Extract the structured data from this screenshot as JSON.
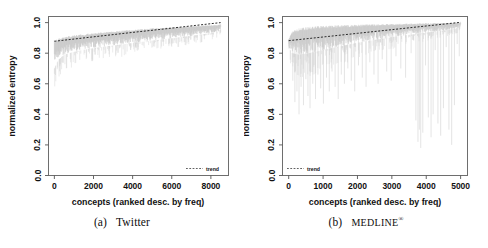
{
  "figure": {
    "kind": "two-panel-figure",
    "background": "#ffffff",
    "data_color": "#c8c8c8",
    "trend_color": "#1a1a1a",
    "axis_color": "#555555"
  },
  "panels": [
    {
      "id": "twitter",
      "caption_prefix": "(a)",
      "caption_name": "Twitter",
      "legend": {
        "label": "trend",
        "position": "bottom-right"
      }
    },
    {
      "id": "medline",
      "caption_prefix": "(b)",
      "caption_name": "MEDLINE",
      "caption_mark": "®",
      "legend": {
        "label": "trend",
        "position": "bottom-left"
      }
    }
  ],
  "chart_data": [
    {
      "type": "area",
      "id": "twitter",
      "title": "",
      "xlabel": "concepts (ranked desc. by freq)",
      "ylabel": "normalized entropy",
      "xlim": [
        -300,
        8900
      ],
      "ylim": [
        0.0,
        1.04
      ],
      "xticks": [
        0,
        2000,
        4000,
        6000,
        8000
      ],
      "xtick_labels": [
        "0",
        "2000",
        "4000",
        "6000",
        "8000"
      ],
      "yticks": [
        0.0,
        0.2,
        0.4,
        0.6,
        0.8,
        1.0
      ],
      "ytick_labels": [
        "0.0",
        "0.2",
        "0.4",
        "0.6",
        "0.8",
        "1.0"
      ],
      "grid": false,
      "legend": [
        "trend"
      ],
      "legend_position": "bottom-right",
      "n_points": 8500,
      "series": [
        {
          "name": "normalized entropy (upper envelope)",
          "style": "band-top",
          "color": "#c8c8c8",
          "x": [
            0,
            200,
            500,
            900,
            1400,
            2000,
            2700,
            3400,
            4100,
            4800,
            5500,
            6200,
            6900,
            7500,
            8000,
            8400,
            8500
          ],
          "values": [
            0.885,
            0.895,
            0.905,
            0.915,
            0.923,
            0.932,
            0.94,
            0.947,
            0.954,
            0.96,
            0.966,
            0.971,
            0.976,
            0.98,
            0.983,
            0.986,
            0.99
          ]
        },
        {
          "name": "normalized entropy (lower envelope)",
          "style": "band-bottom",
          "color": "#c8c8c8",
          "x": [
            0,
            200,
            500,
            900,
            1400,
            2000,
            2700,
            3400,
            4100,
            4800,
            5500,
            6200,
            6900,
            7500,
            8000,
            8400,
            8500
          ],
          "values": [
            0.7,
            0.755,
            0.79,
            0.805,
            0.82,
            0.832,
            0.845,
            0.856,
            0.868,
            0.879,
            0.89,
            0.9,
            0.912,
            0.922,
            0.932,
            0.944,
            0.955
          ]
        },
        {
          "name": "trend",
          "style": "dashed-line",
          "color": "#1a1a1a",
          "x": [
            0,
            2000,
            4000,
            6000,
            8000,
            8500
          ],
          "values": [
            0.878,
            0.907,
            0.936,
            0.964,
            0.993,
            1.0
          ]
        }
      ]
    },
    {
      "type": "area",
      "id": "medline",
      "title": "",
      "xlabel": "concepts (ranked desc. by freq)",
      "ylabel": "normalized entropy",
      "xlim": [
        -180,
        5200
      ],
      "ylim": [
        0.0,
        1.04
      ],
      "xticks": [
        0,
        1000,
        2000,
        3000,
        4000,
        5000
      ],
      "xtick_labels": [
        "0",
        "1000",
        "2000",
        "3000",
        "4000",
        "5000"
      ],
      "yticks": [
        0.0,
        0.2,
        0.4,
        0.6,
        0.8,
        1.0
      ],
      "ytick_labels": [
        "0.0",
        "0.2",
        "0.4",
        "0.6",
        "0.8",
        "1.0"
      ],
      "grid": false,
      "legend": [
        "trend"
      ],
      "legend_position": "bottom-left",
      "n_points": 5000,
      "series": [
        {
          "name": "normalized entropy (upper envelope)",
          "style": "band-top",
          "color": "#c8c8c8",
          "x": [
            0,
            100,
            300,
            600,
            1000,
            1500,
            2000,
            2600,
            3200,
            3800,
            4200,
            4600,
            4900,
            5000
          ],
          "values": [
            0.89,
            0.94,
            0.962,
            0.972,
            0.978,
            0.982,
            0.986,
            0.989,
            0.992,
            0.994,
            0.996,
            0.997,
            0.999,
            1.0
          ]
        },
        {
          "name": "normalized entropy (lower envelope)",
          "style": "band-bottom",
          "color": "#c8c8c8",
          "x": [
            0,
            100,
            300,
            600,
            1000,
            1500,
            2000,
            2600,
            3200,
            3800,
            4200,
            4600,
            4900,
            5000
          ],
          "values": [
            0.84,
            0.8,
            0.79,
            0.8,
            0.82,
            0.845,
            0.868,
            0.89,
            0.912,
            0.928,
            0.94,
            0.95,
            0.962,
            0.975
          ]
        },
        {
          "name": "downward spikes (min per bin)",
          "style": "spikes",
          "color": "#d2d2d2",
          "x": [
            120,
            180,
            240,
            300,
            360,
            430,
            500,
            560,
            620,
            700,
            780,
            850,
            930,
            1010,
            1100,
            1180,
            1260,
            1350,
            1440,
            1530,
            1620,
            1720,
            1820,
            1920,
            2030,
            2140,
            2250,
            2360,
            2480,
            2600,
            2720,
            2850,
            2980,
            3120,
            3260,
            3400,
            3560,
            3700,
            3760,
            3800,
            3840,
            3900,
            3980,
            4060,
            4140,
            4200,
            4260,
            4340,
            4420,
            4500,
            4580,
            4660,
            4740,
            4820,
            4900,
            4960
          ],
          "values": [
            0.62,
            0.48,
            0.55,
            0.4,
            0.58,
            0.46,
            0.63,
            0.52,
            0.44,
            0.6,
            0.5,
            0.66,
            0.57,
            0.47,
            0.64,
            0.55,
            0.68,
            0.58,
            0.5,
            0.66,
            0.6,
            0.7,
            0.62,
            0.55,
            0.72,
            0.64,
            0.58,
            0.74,
            0.66,
            0.6,
            0.76,
            0.68,
            0.62,
            0.78,
            0.7,
            0.64,
            0.8,
            0.36,
            0.22,
            0.3,
            0.18,
            0.28,
            0.72,
            0.38,
            0.25,
            0.4,
            0.82,
            0.34,
            0.26,
            0.44,
            0.84,
            0.3,
            0.2,
            0.46,
            0.86,
            0.78
          ]
        },
        {
          "name": "trend",
          "style": "dashed-line",
          "color": "#1a1a1a",
          "x": [
            0,
            1000,
            2000,
            3000,
            4000,
            5000
          ],
          "values": [
            0.882,
            0.906,
            0.93,
            0.954,
            0.978,
            1.002
          ]
        }
      ]
    }
  ]
}
